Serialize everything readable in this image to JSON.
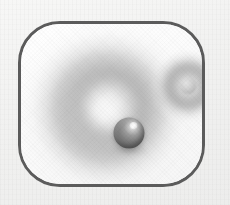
{
  "image": {
    "title": "Sphere with halo icon",
    "description": "Rounded-square framed illustration of a dark glossy sphere surrounded by a soft circular halo, with a smaller dimmer sphere and halo in the upper right",
    "canvas": {
      "width_px": 230,
      "height_px": 205,
      "background_color": "#f3f3f2"
    }
  },
  "frame": {
    "shape": "rounded-square",
    "outline_color": "#5b5b5b",
    "outline_width_px": 3,
    "corner_radius_px": 42,
    "fill_color": "#fdfdfd",
    "x_px": 18,
    "y_px": 21,
    "width_px": 187,
    "height_px": 166
  },
  "objects": {
    "main_sphere": {
      "label": "main sphere",
      "center_x_px": 108,
      "center_y_px": 109,
      "diameter_px": 31,
      "body_color": "#7d7d7d",
      "shadow_color": "#575757",
      "highlight_color": "#ffffff",
      "highlight_position": "upper-right"
    },
    "main_halo": {
      "label": "main halo ring",
      "center_x_px": 106,
      "center_y_px": 105,
      "width_px": 190,
      "height_px": 180,
      "ring_color": "#b0b0b0",
      "edge_color": "#ffffff"
    },
    "satellite_sphere": {
      "label": "satellite sphere",
      "center_x_px": 167,
      "center_y_px": 62,
      "diameter_px": 17,
      "body_color": "#cfcfcf",
      "edge_color": "#a9a9a9"
    },
    "satellite_halo": {
      "label": "satellite halo ring",
      "center_x_px": 167,
      "center_y_px": 62,
      "width_px": 78,
      "height_px": 76,
      "ring_color": "#a0a0a0"
    }
  },
  "palette": {
    "outline": "#5b5b5b",
    "sphere_dark": "#575757",
    "sphere_mid": "#7d7d7d",
    "halo_gray": "#b0b0b0",
    "interior_white": "#fdfdfd",
    "page_background": "#f3f3f2"
  }
}
